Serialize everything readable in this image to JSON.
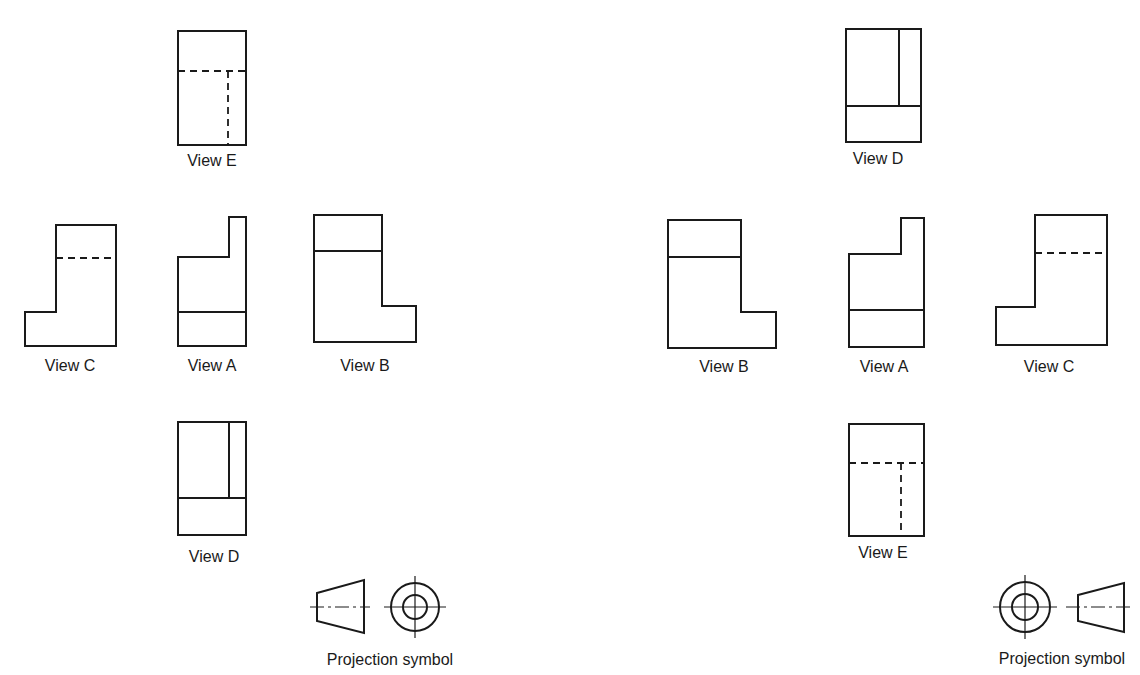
{
  "left_arrangement": {
    "views": [
      {
        "id": "E",
        "label": "View E"
      },
      {
        "id": "C",
        "label": "View C"
      },
      {
        "id": "A",
        "label": "View A"
      },
      {
        "id": "B",
        "label": "View B"
      },
      {
        "id": "D",
        "label": "View D"
      }
    ],
    "symbol_label": "Projection symbol"
  },
  "right_arrangement": {
    "views": [
      {
        "id": "D",
        "label": "View D"
      },
      {
        "id": "B",
        "label": "View B"
      },
      {
        "id": "A",
        "label": "View A"
      },
      {
        "id": "C",
        "label": "View C"
      },
      {
        "id": "E",
        "label": "View E"
      }
    ],
    "symbol_label": "Projection symbol"
  },
  "colors": {
    "line": "#1a1a1a",
    "background": "#ffffff"
  }
}
